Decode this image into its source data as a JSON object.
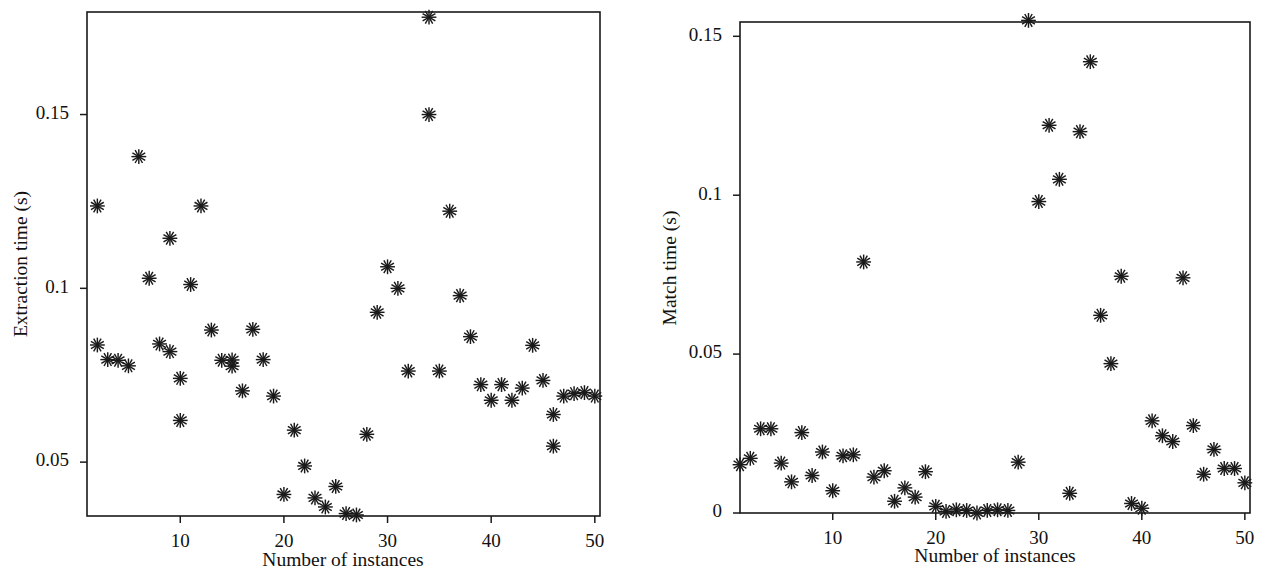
{
  "figure": {
    "background": "#ffffff",
    "marker_color": "#1a1a1a",
    "marker_symbol": "asterisk",
    "panel_count": 2
  },
  "chart_data": [
    {
      "type": "scatter",
      "panel": "left",
      "title": "",
      "xlabel": "Number of instances",
      "ylabel": "Extraction time (s)",
      "xlim": [
        1,
        50.5
      ],
      "ylim": [
        0.0345,
        0.1795
      ],
      "xticks": [
        10,
        20,
        30,
        40,
        50
      ],
      "xticklabels": [
        "10",
        "20",
        "30",
        "40",
        "50"
      ],
      "yticks": [
        0.05,
        0.1,
        0.15
      ],
      "yticklabels": [
        "0.05",
        "0.1",
        "0.15"
      ],
      "grid": false,
      "legend": null,
      "x": [
        2,
        2,
        3,
        4,
        5,
        6,
        7,
        8,
        9,
        9,
        10,
        10,
        11,
        12,
        13,
        14,
        15,
        15,
        16,
        17,
        18,
        19,
        20,
        21,
        22,
        23,
        24,
        25,
        26,
        27,
        28,
        29,
        30,
        31,
        32,
        34,
        34,
        35,
        36,
        37,
        38,
        39,
        40,
        41,
        42,
        43,
        44,
        45,
        46,
        46,
        47,
        48,
        49,
        50
      ],
      "y": [
        0.1237,
        0.0837,
        0.0795,
        0.0793,
        0.0777,
        0.1379,
        0.1029,
        0.084,
        0.0818,
        0.1144,
        0.062,
        0.0741,
        0.1011,
        0.1237,
        0.088,
        0.0793,
        0.0794,
        0.0776,
        0.0705,
        0.0882,
        0.0795,
        0.069,
        0.0407,
        0.0592,
        0.0489,
        0.0397,
        0.0371,
        0.043,
        0.0352,
        0.0348,
        0.058,
        0.0931,
        0.1062,
        0.1,
        0.0762,
        0.178,
        0.15,
        0.0762,
        0.1222,
        0.0979,
        0.0861,
        0.0723,
        0.0678,
        0.0723,
        0.0678,
        0.0713,
        0.0836,
        0.0735,
        0.0546,
        0.0637,
        0.069,
        0.0697,
        0.07,
        0.069
      ]
    },
    {
      "type": "scatter",
      "panel": "right",
      "title": "",
      "xlabel": "Number of instances",
      "ylabel": "Match time (s)",
      "xlim": [
        1,
        50.5
      ],
      "ylim": [
        0,
        0.1545
      ],
      "xticks": [
        10,
        20,
        30,
        40,
        50
      ],
      "xticklabels": [
        "10",
        "20",
        "30",
        "40",
        "50"
      ],
      "yticks": [
        0,
        0.05,
        0.1,
        0.15
      ],
      "yticklabels": [
        "0",
        "0.05",
        "0.1",
        "0.15"
      ],
      "grid": false,
      "legend": null,
      "x": [
        1,
        2,
        3,
        4,
        5,
        6,
        7,
        8,
        9,
        10,
        11,
        12,
        13,
        14,
        15,
        16,
        17,
        18,
        19,
        20,
        21,
        22,
        23,
        24,
        25,
        26,
        27,
        28,
        29,
        30,
        31,
        32,
        33,
        34,
        35,
        36,
        37,
        38,
        39,
        40,
        41,
        42,
        43,
        44,
        45,
        46,
        47,
        48,
        49,
        50
      ],
      "y": [
        0.0152,
        0.0172,
        0.0265,
        0.0265,
        0.0157,
        0.0098,
        0.0253,
        0.0118,
        0.0192,
        0.007,
        0.018,
        0.0183,
        0.079,
        0.0113,
        0.0133,
        0.0037,
        0.0079,
        0.005,
        0.013,
        0.0021,
        0.0005,
        0.001,
        0.0008,
        0.0,
        0.0008,
        0.001,
        0.0008,
        0.016,
        0.155,
        0.098,
        0.122,
        0.105,
        0.0062,
        0.12,
        0.142,
        0.0622,
        0.047,
        0.0745,
        0.003,
        0.0015,
        0.029,
        0.0243,
        0.0225,
        0.074,
        0.0275,
        0.0122,
        0.02,
        0.014,
        0.014,
        0.0095
      ]
    }
  ]
}
